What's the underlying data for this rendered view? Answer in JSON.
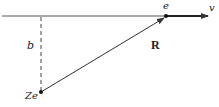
{
  "diagram": {
    "type": "coulomb-scattering-geometry",
    "labels": {
      "electron": "e",
      "velocity": "v",
      "impact_parameter": "b",
      "position_vector": "R",
      "nucleus": "Ze"
    },
    "colors": {
      "line": "#333333",
      "background": "#ffffff"
    }
  }
}
